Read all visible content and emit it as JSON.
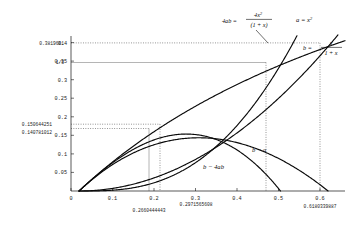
{
  "chart_data": {
    "type": "line",
    "title": "",
    "xlabel": "",
    "ylabel": "",
    "xlim": [
      -0.02,
      0.66
    ],
    "ylim": [
      0,
      0.41
    ],
    "grid": false,
    "legend_position": "inline-annotations",
    "xticks": [
      "0",
      "0.1",
      "0.2",
      "0.3",
      "0.4",
      "0.5",
      "0.6"
    ],
    "xtick_values": [
      0,
      0.1,
      0.2,
      0.3,
      0.4,
      0.5,
      0.6
    ],
    "yticks": [
      "0.05",
      "0.1",
      "0.15",
      "0.2",
      "0.25",
      "0.3",
      "0.35",
      "0.4"
    ],
    "ytick_values": [
      0.05,
      0.1,
      0.15,
      0.2,
      0.25,
      0.3,
      0.35,
      0.4
    ],
    "special_ylabels": [
      {
        "text": "0.3819661",
        "value": 0.3819661
      },
      {
        "text": "1/3",
        "value": 0.3333333
      },
      {
        "text": "0.150644251",
        "value": 0.150644251
      },
      {
        "text": "0.140781012",
        "value": 0.140781012
      }
    ],
    "special_xlabels": [
      {
        "text": "0.2660444443",
        "value": 0.2660444443
      },
      {
        "text": "0.2971565608",
        "value": 0.2971565608
      },
      {
        "text": "0.6180339887",
        "value": 0.6180339887
      }
    ],
    "series": [
      {
        "name": "a",
        "label": "a = x",
        "label_exponent": "2",
        "expression": "x^2",
        "x": [
          0,
          0.05,
          0.1,
          0.15,
          0.2,
          0.25,
          0.3,
          0.35,
          0.4,
          0.45,
          0.5,
          0.55,
          0.6,
          0.6180339887,
          0.64
        ],
        "y": [
          0,
          0.0025,
          0.01,
          0.0225,
          0.04,
          0.0625,
          0.09,
          0.1225,
          0.16,
          0.2025,
          0.25,
          0.3025,
          0.36,
          0.3819661,
          0.4096
        ]
      },
      {
        "name": "b",
        "label": "b =",
        "numerator": "x",
        "denominator": "1 + x",
        "expression": "x/(1+x)",
        "x": [
          0,
          0.05,
          0.1,
          0.15,
          0.2,
          0.25,
          0.3,
          0.35,
          0.4,
          0.45,
          0.5,
          0.55,
          0.6,
          0.6180339887,
          0.64
        ],
        "y": [
          0,
          0.04762,
          0.09091,
          0.13043,
          0.16667,
          0.2,
          0.23077,
          0.25926,
          0.28571,
          0.31034,
          0.33333,
          0.35484,
          0.375,
          0.3819661,
          0.39024
        ]
      },
      {
        "name": "4ab",
        "label": "4ab =",
        "numerator": "4x",
        "numerator_exponent": "2",
        "denominator": "(1 + x)",
        "expression": "4x^3/(1+x)",
        "x": [
          0,
          0.05,
          0.1,
          0.15,
          0.2,
          0.25,
          0.3,
          0.35,
          0.4,
          0.45,
          0.5,
          0.5199,
          0.54
        ],
        "y": [
          0,
          0.000476,
          0.003636,
          0.011739,
          0.026667,
          0.05,
          0.083077,
          0.127037,
          0.182857,
          0.251379,
          0.333333,
          0.37,
          0.4093
        ]
      },
      {
        "name": "b-a",
        "label": "b − a",
        "expression": "x/(1+x) - x^2",
        "x": [
          0,
          0.05,
          0.1,
          0.15,
          0.2,
          0.2660444443,
          0.3,
          0.35,
          0.4,
          0.45,
          0.5,
          0.55,
          0.6,
          0.6180339887
        ],
        "y": [
          0,
          0.04512,
          0.08091,
          0.10793,
          0.12667,
          0.13998,
          0.14077,
          0.13676,
          0.12571,
          0.10784,
          0.08333,
          0.05234,
          0.015,
          0.0
        ]
      },
      {
        "name": "b-4ab",
        "label": "b − 4ab",
        "expression": "x/(1+x) - 4x^3/(1+x)",
        "x": [
          0,
          0.05,
          0.1,
          0.15,
          0.2,
          0.25,
          0.2971565608,
          0.32,
          0.35,
          0.4,
          0.45,
          0.5,
          0.5199
        ],
        "y": [
          0,
          0.04714,
          0.08727,
          0.11869,
          0.14,
          0.15,
          0.150644251,
          0.14925,
          0.14,
          0.10286,
          0.05896,
          0.0,
          -0.0367
        ]
      }
    ],
    "intersection_markers": [
      {
        "x": 0.2660444443,
        "y": 0.140781012,
        "note": "max of b-a"
      },
      {
        "x": 0.2971565608,
        "y": 0.150644251,
        "note": "max of b-4ab"
      },
      {
        "x": 0.5,
        "y": 0.3333333,
        "note": "b = 4ab crossing"
      },
      {
        "x": 0.6180339887,
        "y": 0.3819661,
        "note": "a = b crossing"
      }
    ]
  },
  "labels": {
    "fourab_lhs": "4ab =",
    "fourab_num": "4x",
    "fourab_num_sup": "2",
    "fourab_den": "(1 + x)",
    "a_label": "a = x",
    "a_label_sup": "2",
    "b_lhs": "b =",
    "b_num": "x",
    "b_den": "1 + x",
    "b_minus_a": "b − a",
    "b_minus_4ab": "b − 4ab"
  }
}
